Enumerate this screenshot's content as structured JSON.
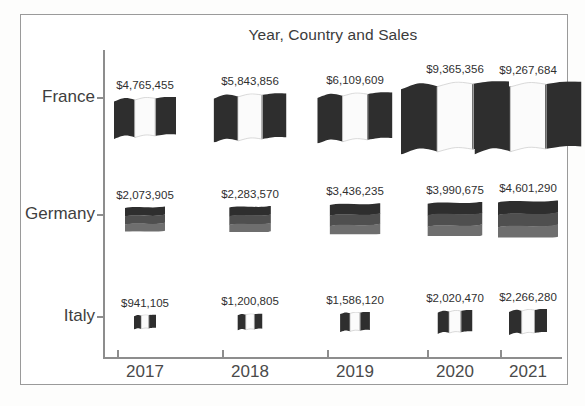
{
  "chart_data": {
    "type": "scatter",
    "title": "Year, Country and Sales",
    "xlabel": "",
    "ylabel": "",
    "categories": [
      "2017",
      "2018",
      "2019",
      "2020",
      "2021"
    ],
    "y_categories": [
      "France",
      "Germany",
      "Italy"
    ],
    "grid": false,
    "legend": "none",
    "marker": "country-flag-pictogram-sized-by-value",
    "series": [
      {
        "name": "France",
        "flag": "france-flag-icon",
        "values": [
          4765455,
          5843856,
          6109609,
          9365356,
          9267684
        ],
        "labels": [
          "$4,765,455",
          "$5,843,856",
          "$6,109,609",
          "$9,365,356",
          "$9,267,684"
        ]
      },
      {
        "name": "Germany",
        "flag": "germany-flag-icon",
        "values": [
          2073905,
          2283570,
          3436235,
          3990675,
          4601290
        ],
        "labels": [
          "$2,073,905",
          "$2,283,570",
          "$3,436,235",
          "$3,990,675",
          "$4,601,290"
        ]
      },
      {
        "name": "Italy",
        "flag": "italy-flag-icon",
        "values": [
          941105,
          1200805,
          1586120,
          2020470,
          2266280
        ],
        "labels": [
          "$941,105",
          "$1,200,805",
          "$1,586,120",
          "$2,020,470",
          "$2,266,280"
        ]
      }
    ]
  },
  "axes": {
    "x_tick_labels": [
      "2017",
      "2018",
      "2019",
      "2020",
      "2021"
    ],
    "y_tick_labels": [
      "France",
      "Germany",
      "Italy"
    ]
  },
  "colors": {
    "axis": "#8d8d8d",
    "title_text": "#3b3b3b",
    "label_text": "#2f2f2f",
    "border": "#9a9a9a",
    "flag_dark": "#2e2e2e",
    "flag_mid": "#4f4f4f",
    "flag_light": "#6e6e6e",
    "flag_white": "#fbfbfb",
    "background": "#ffffff"
  }
}
